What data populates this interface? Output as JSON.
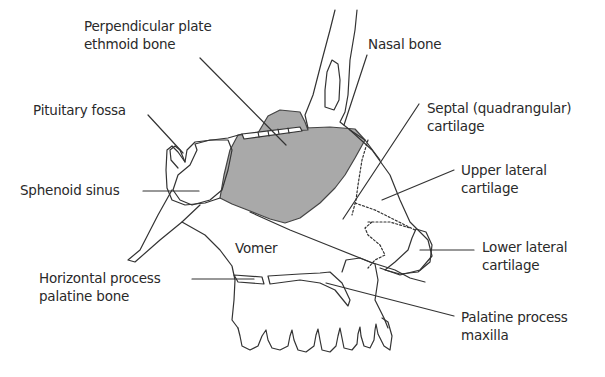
{
  "diagram": {
    "type": "anatomical-illustration",
    "colors": {
      "bone_fill": "#a9a9a9",
      "outline": "#333333",
      "background": "#ffffff"
    },
    "labels": {
      "perpendicular_plate": {
        "line1": "Perpendicular plate",
        "line2": "ethmoid bone"
      },
      "nasal_bone": {
        "line1": "Nasal bone"
      },
      "pituitary_fossa": {
        "line1": "Pituitary fossa"
      },
      "septal_cartilage": {
        "line1": "Septal (quadrangular)",
        "line2": "cartilage"
      },
      "sphenoid_sinus": {
        "line1": "Sphenoid sinus"
      },
      "upper_lateral": {
        "line1": "Upper lateral",
        "line2": "cartilage"
      },
      "vomer": {
        "line1": "Vomer"
      },
      "lower_lateral": {
        "line1": "Lower lateral",
        "line2": "cartilage"
      },
      "horizontal_process": {
        "line1": "Horizontal process",
        "line2": "palatine bone"
      },
      "palatine_process": {
        "line1": "Palatine process",
        "line2": "maxilla"
      }
    }
  }
}
